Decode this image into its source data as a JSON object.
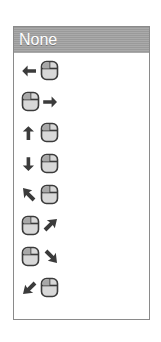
{
  "listbox": {
    "selected": {
      "label": "None",
      "highlight_color": "#9a9a9a",
      "text_color": "#ffffff"
    },
    "border_color": "#8a8a8a",
    "background_color": "#ffffff",
    "icon_color": "#3b3b3b",
    "mouse_body_color": "#d8d8d8",
    "mouse_button_shade": "#a8a8a8",
    "options": [
      {
        "icon": "mouse-move-left-icon",
        "arrow": "arrow-left",
        "order": "arrow-first",
        "label": ""
      },
      {
        "icon": "mouse-move-right-icon",
        "arrow": "arrow-right",
        "order": "mouse-first",
        "label": ""
      },
      {
        "icon": "mouse-move-up-icon",
        "arrow": "arrow-up",
        "order": "arrow-first",
        "label": ""
      },
      {
        "icon": "mouse-move-down-icon",
        "arrow": "arrow-down",
        "order": "arrow-first",
        "label": ""
      },
      {
        "icon": "mouse-move-up-left-icon",
        "arrow": "arrow-up-left",
        "order": "arrow-first",
        "label": ""
      },
      {
        "icon": "mouse-move-up-right-icon",
        "arrow": "arrow-up-right",
        "order": "mouse-first",
        "label": ""
      },
      {
        "icon": "mouse-move-down-right-icon",
        "arrow": "arrow-down-right",
        "order": "mouse-first",
        "label": ""
      },
      {
        "icon": "mouse-move-down-left-icon",
        "arrow": "arrow-down-left",
        "order": "arrow-first",
        "label": ""
      }
    ]
  }
}
